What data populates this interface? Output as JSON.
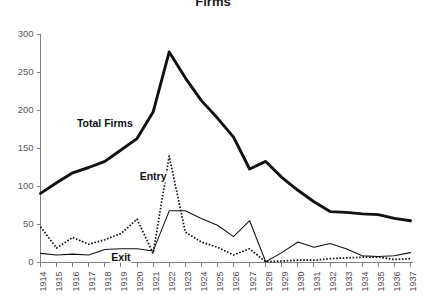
{
  "figure": {
    "cropped_title_fragment": "Firms",
    "background_color": "#ffffff"
  },
  "chart_data": {
    "type": "line",
    "title": "",
    "xlabel": "",
    "ylabel": "",
    "ylim": [
      0,
      300
    ],
    "yticks": [
      0,
      50,
      100,
      150,
      200,
      250,
      300
    ],
    "ytick_labels": [
      "0",
      "50",
      "100",
      "150",
      "200",
      "250",
      "300"
    ],
    "grid": false,
    "legend_position": "inline-annotations",
    "categories": [
      "1914",
      "1915",
      "1916",
      "1917",
      "1918",
      "1919",
      "1920",
      "1921",
      "1922",
      "1923",
      "1924",
      "1925",
      "1926",
      "1927",
      "1928",
      "1929",
      "1930",
      "1931",
      "1932",
      "1933",
      "1934",
      "1935",
      "1936",
      "1937"
    ],
    "series": [
      {
        "name": "Total Firms",
        "style": "thick-solid",
        "color": "#111111",
        "label_x_category": "1918",
        "label_y_value": 182,
        "values": [
          91,
          105,
          118,
          125,
          133,
          148,
          163,
          198,
          277,
          243,
          213,
          190,
          165,
          123,
          133,
          112,
          95,
          80,
          67,
          66,
          64,
          63,
          58,
          55
        ]
      },
      {
        "name": "Entry",
        "style": "dotted",
        "color": "#111111",
        "label_x_category": "1921",
        "label_y_value": 112,
        "values": [
          47,
          19,
          33,
          24,
          30,
          38,
          57,
          12,
          140,
          40,
          27,
          20,
          10,
          18,
          1,
          2,
          3,
          3,
          5,
          6,
          7,
          7,
          4,
          5
        ]
      },
      {
        "name": "Exit",
        "style": "thin-solid",
        "color": "#111111",
        "label_x_category": "1919",
        "label_y_value": 6,
        "values": [
          12,
          10,
          11,
          10,
          17,
          18,
          18,
          15,
          68,
          68,
          58,
          49,
          34,
          55,
          1,
          13,
          27,
          20,
          25,
          18,
          9,
          8,
          9,
          13
        ]
      }
    ]
  }
}
